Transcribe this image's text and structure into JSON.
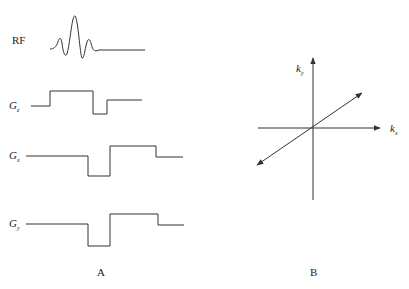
{
  "panel_a": {
    "caption": "A",
    "rows": [
      {
        "label": "RF",
        "label_sub": ""
      },
      {
        "label": "G",
        "label_sub": "z"
      },
      {
        "label": "G",
        "label_sub": "x"
      },
      {
        "label": "G",
        "label_sub": "y"
      }
    ]
  },
  "panel_b": {
    "caption": "B",
    "y_axis": {
      "label": "k",
      "label_sub": "y"
    },
    "x_axis": {
      "label": "k",
      "label_sub": "x"
    }
  },
  "colors": {
    "line": "#333333",
    "text": "#222222",
    "background": "#ffffff"
  }
}
